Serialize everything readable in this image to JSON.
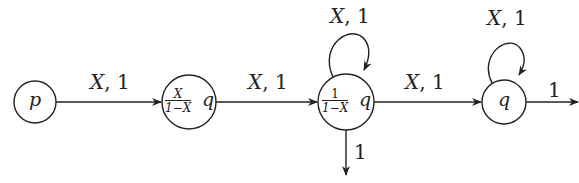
{
  "diagram": {
    "type": "weighted-automaton",
    "nodes": [
      {
        "id": "p",
        "label": "p"
      },
      {
        "id": "n2",
        "label_num": "X",
        "label_den": "1−X",
        "label_suffix": "q"
      },
      {
        "id": "n3",
        "label_num": "1",
        "label_den": "1−X",
        "label_suffix": "q"
      },
      {
        "id": "q",
        "label": "q"
      }
    ],
    "edges": [
      {
        "from": "p",
        "to": "n2",
        "label_var": "X",
        "label_weight": ", 1"
      },
      {
        "from": "n2",
        "to": "n3",
        "label_var": "X",
        "label_weight": ", 1"
      },
      {
        "from": "n3",
        "to": "n3",
        "label_var": "X",
        "label_weight": ", 1"
      },
      {
        "from": "n3",
        "to": "q",
        "label_var": "X",
        "label_weight": ", 1"
      },
      {
        "from": "q",
        "to": "q",
        "label_var": "X",
        "label_weight": ", 1"
      },
      {
        "from": "n3",
        "to": "out-down",
        "label": "1"
      },
      {
        "from": "q",
        "to": "out-right",
        "label": "1"
      }
    ],
    "colors": {
      "stroke": "#222222",
      "background": "#ffffff"
    }
  }
}
